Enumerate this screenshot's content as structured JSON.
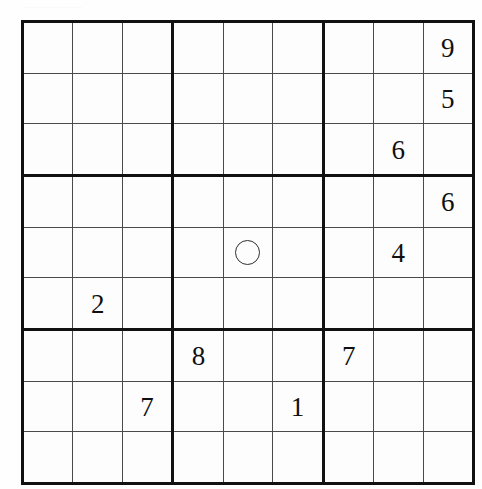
{
  "page": {
    "background_color": "#fefefe",
    "header_smudge_text": "......................."
  },
  "puzzle": {
    "type": "sudoku",
    "title": "Sudoku Grid",
    "size": 9,
    "box_size": 3,
    "grid_line_color": "#4a4a4a",
    "block_line_color": "#111111",
    "digit_color": "#101010",
    "marker": {
      "name": "circle-marker",
      "shape": "circle",
      "row": 5,
      "col": 5,
      "stroke_color": "#2e2e2e",
      "diameter_px": 25
    },
    "givens": [
      {
        "row": 1,
        "col": 9,
        "value": "9"
      },
      {
        "row": 2,
        "col": 9,
        "value": "5"
      },
      {
        "row": 3,
        "col": 8,
        "value": "6"
      },
      {
        "row": 4,
        "col": 9,
        "value": "6"
      },
      {
        "row": 5,
        "col": 8,
        "value": "4"
      },
      {
        "row": 6,
        "col": 2,
        "value": "2"
      },
      {
        "row": 7,
        "col": 4,
        "value": "8"
      },
      {
        "row": 7,
        "col": 7,
        "value": "7"
      },
      {
        "row": 8,
        "col": 3,
        "value": "7"
      },
      {
        "row": 8,
        "col": 6,
        "value": "1"
      }
    ],
    "rows": [
      [
        "",
        "",
        "",
        "",
        "",
        "",
        "",
        "",
        "9"
      ],
      [
        "",
        "",
        "",
        "",
        "",
        "",
        "",
        "",
        "5"
      ],
      [
        "",
        "",
        "",
        "",
        "",
        "",
        "",
        "6",
        ""
      ],
      [
        "",
        "",
        "",
        "",
        "",
        "",
        "",
        "",
        "6"
      ],
      [
        "",
        "",
        "",
        "",
        "O",
        "",
        "",
        "4",
        ""
      ],
      [
        "",
        "2",
        "",
        "",
        "",
        "",
        "",
        "",
        ""
      ],
      [
        "",
        "",
        "",
        "8",
        "",
        "",
        "7",
        "",
        ""
      ],
      [
        "",
        "",
        "7",
        "",
        "",
        "1",
        "",
        "",
        ""
      ],
      [
        "",
        "",
        "",
        "",
        "",
        "",
        "",
        "",
        ""
      ]
    ]
  }
}
